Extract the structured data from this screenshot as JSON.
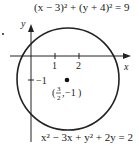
{
  "equations": {
    "top": "(x − 3)² + (y + 4)² = 9",
    "bottom": "x² − 3x + y² + 2y = 2"
  },
  "axes": {
    "x_label": "x",
    "y_label": "y",
    "x_ticks": [
      "1",
      "2"
    ],
    "y_ticks": [
      "−1"
    ]
  },
  "point": {
    "label": "(3/2, −1)",
    "num": "3",
    "den": "2",
    "y": "−1"
  },
  "circle": {
    "center": [
      1.5,
      -1
    ],
    "equation": "x² − 3x + y² + 2y = 2"
  },
  "colors": {
    "stroke": "#222222",
    "background": "#ffffff"
  }
}
